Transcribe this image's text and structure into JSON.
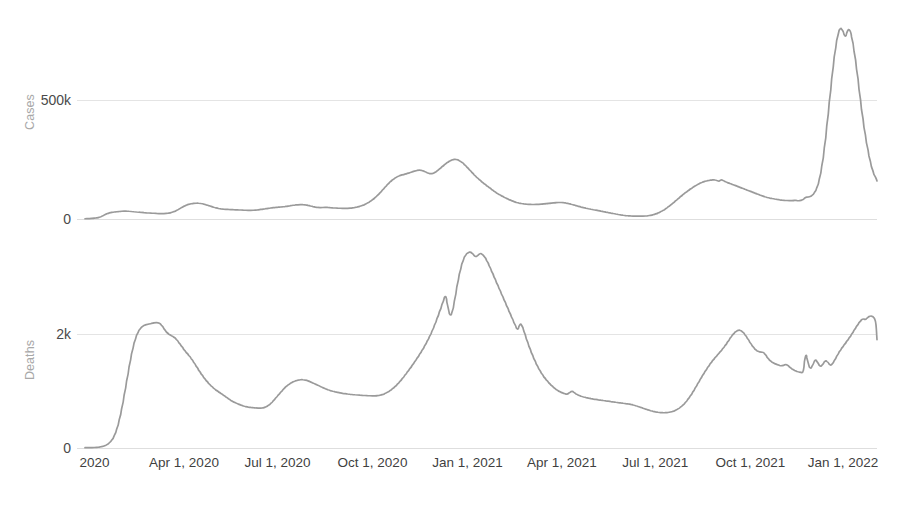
{
  "chart_data": {
    "type": "line",
    "title": "",
    "subtitle": "",
    "layout": "two stacked panels sharing one x axis",
    "grid": true,
    "legend": false,
    "legend_position": "none",
    "line_color": "#9a9a9a",
    "gridline_color": "#e4e4e4",
    "axis_label_color": "#a8a8a8",
    "tick_label_color": "#4a4a4a",
    "xlabel": "",
    "x_range": [
      "2020-01-22",
      "2022-02-20"
    ],
    "x_tick_labels": [
      "2020",
      "Apr 1, 2020",
      "Jul 1, 2020",
      "Oct 1, 2020",
      "Jan 1, 2021",
      "Apr 1, 2021",
      "Jul 1, 2021",
      "Oct 1, 2021",
      "Jan 1, 2022"
    ],
    "x_tick_positions_frac": [
      0.012,
      0.125,
      0.243,
      0.363,
      0.483,
      0.602,
      0.72,
      0.84,
      0.957
    ],
    "panels": [
      {
        "name": "cases",
        "ylabel": "Cases",
        "y_tick_labels": [
          "0",
          "500k"
        ],
        "y_tick_values": [
          0,
          500000
        ],
        "ylim": [
          0,
          1000000
        ],
        "series_name": "Cases",
        "description": "7-day average of new reported COVID-19 cases",
        "values": [
          1000,
          1500,
          2000,
          3000,
          4000,
          6000,
          9000,
          14000,
          20000,
          24000,
          27000,
          29000,
          30000,
          31000,
          32000,
          33000,
          33500,
          33000,
          32000,
          31000,
          30000,
          29000,
          28000,
          27000,
          26000,
          25500,
          25000,
          24500,
          24000,
          23000,
          22500,
          22500,
          23000,
          24000,
          26000,
          29000,
          33000,
          38000,
          44000,
          50000,
          56000,
          60000,
          63000,
          65000,
          66000,
          66500,
          66000,
          64000,
          61000,
          58000,
          55000,
          51000,
          48000,
          45000,
          43000,
          42000,
          41000,
          40500,
          40000,
          39500,
          39000,
          38500,
          38000,
          37500,
          37000,
          36500,
          36000,
          36500,
          37000,
          38000,
          39500,
          41000,
          42500,
          44000,
          45500,
          47000,
          48000,
          49000,
          50000,
          51000,
          52000,
          53500,
          55000,
          57000,
          58500,
          59500,
          60000,
          60500,
          60000,
          58500,
          56000,
          53500,
          51000,
          49000,
          48000,
          48000,
          48500,
          49000,
          48500,
          47500,
          46500,
          46000,
          45500,
          45000,
          44500,
          44500,
          45000,
          46000,
          47500,
          49500,
          52000,
          55000,
          59000,
          64000,
          70000,
          77000,
          85000,
          94000,
          104000,
          115000,
          127000,
          139000,
          150000,
          160000,
          168000,
          175000,
          180000,
          184000,
          187000,
          190000,
          193000,
          196000,
          200000,
          203000,
          205000,
          205000,
          202000,
          197000,
          192000,
          190000,
          192000,
          198000,
          206000,
          215000,
          224000,
          232000,
          240000,
          246000,
          250000,
          251000,
          248000,
          242000,
          234000,
          224000,
          213000,
          202000,
          191000,
          180000,
          170000,
          161000,
          152000,
          144000,
          136000,
          128000,
          120000,
          113000,
          106000,
          100000,
          94000,
          89000,
          84000,
          79000,
          75000,
          71000,
          68000,
          66000,
          64000,
          63000,
          62000,
          61500,
          61000,
          61000,
          61500,
          62000,
          63000,
          64000,
          65000,
          66000,
          67000,
          68000,
          69000,
          69500,
          69000,
          68000,
          66000,
          63500,
          60500,
          57500,
          54500,
          51500,
          49000,
          46500,
          44000,
          42000,
          40000,
          38000,
          36000,
          34000,
          32000,
          30000,
          28000,
          26000,
          24000,
          22000,
          20000,
          18000,
          16500,
          15000,
          14000,
          13000,
          12500,
          12000,
          11800,
          11700,
          11800,
          12200,
          13000,
          14500,
          16500,
          19500,
          23000,
          27500,
          33000,
          39000,
          46000,
          54000,
          62000,
          71000,
          80000,
          89000,
          98000,
          106000,
          114000,
          122000,
          129000,
          136000,
          142000,
          148000,
          153000,
          157000,
          160000,
          162000,
          164000,
          165000,
          163000,
          158000,
          166000,
          160000,
          155000,
          151000,
          147000,
          143000,
          139000,
          135000,
          131000,
          127000,
          123000,
          119000,
          115000,
          111000,
          107000,
          103000,
          99000,
          95000,
          92000,
          89000,
          87000,
          85000,
          83000,
          81500,
          80000,
          79000,
          78000,
          77500,
          77000,
          77500,
          79000,
          76000,
          78000,
          82000,
          92000,
          92000,
          95000,
          103000,
          118000,
          145000,
          190000,
          255000,
          340000,
          440000,
          540000,
          640000,
          720000,
          780000,
          806000,
          790000,
          760000,
          800000,
          790000,
          740000,
          670000,
          590000,
          500000,
          420000,
          350000,
          290000,
          240000,
          200000,
          175000,
          160000
        ]
      },
      {
        "name": "deaths",
        "ylabel": "Deaths",
        "y_tick_labels": [
          "0",
          "2k"
        ],
        "y_tick_values": [
          0,
          2000
        ],
        "ylim": [
          0,
          4000
        ],
        "series_name": "Deaths",
        "description": "7-day average of new reported COVID-19 deaths",
        "values": [
          5,
          5,
          6,
          8,
          10,
          14,
          20,
          30,
          45,
          70,
          110,
          170,
          260,
          400,
          580,
          800,
          1050,
          1300,
          1550,
          1760,
          1920,
          2030,
          2100,
          2140,
          2160,
          2170,
          2180,
          2190,
          2200,
          2200,
          2180,
          2130,
          2060,
          2010,
          1980,
          1960,
          1930,
          1880,
          1820,
          1760,
          1700,
          1650,
          1600,
          1540,
          1470,
          1400,
          1330,
          1270,
          1210,
          1160,
          1110,
          1070,
          1030,
          1000,
          970,
          940,
          910,
          880,
          850,
          820,
          800,
          780,
          760,
          745,
          730,
          720,
          715,
          710,
          705,
          700,
          698,
          700,
          710,
          730,
          760,
          800,
          850,
          900,
          950,
          1000,
          1050,
          1090,
          1120,
          1150,
          1170,
          1185,
          1195,
          1200,
          1195,
          1185,
          1170,
          1150,
          1130,
          1110,
          1090,
          1070,
          1050,
          1030,
          1015,
          1000,
          990,
          980,
          970,
          962,
          955,
          950,
          945,
          940,
          936,
          932,
          928,
          925,
          922,
          920,
          918,
          916,
          914,
          915,
          920,
          930,
          945,
          965,
          990,
          1020,
          1055,
          1095,
          1140,
          1190,
          1245,
          1300,
          1360,
          1420,
          1480,
          1545,
          1610,
          1680,
          1750,
          1830,
          1910,
          2000,
          2100,
          2210,
          2330,
          2450,
          2580,
          2700,
          2420,
          2300,
          2450,
          2700,
          2950,
          3150,
          3300,
          3390,
          3430,
          3440,
          3400,
          3350,
          3380,
          3420,
          3390,
          3330,
          3250,
          3150,
          3050,
          2950,
          2850,
          2750,
          2650,
          2550,
          2450,
          2350,
          2250,
          2150,
          2060,
          2200,
          2120,
          1980,
          1850,
          1730,
          1620,
          1520,
          1430,
          1350,
          1280,
          1220,
          1170,
          1120,
          1080,
          1040,
          1010,
          985,
          965,
          950,
          940,
          980,
          1000,
          960,
          935,
          915,
          900,
          890,
          880,
          870,
          862,
          855,
          848,
          842,
          836,
          830,
          824,
          818,
          812,
          806,
          800,
          794,
          788,
          782,
          776,
          770,
          760,
          748,
          735,
          720,
          705,
          690,
          675,
          660,
          648,
          638,
          630,
          624,
          620,
          618,
          620,
          626,
          636,
          650,
          670,
          696,
          730,
          772,
          822,
          880,
          945,
          1015,
          1090,
          1165,
          1240,
          1310,
          1380,
          1445,
          1505,
          1560,
          1610,
          1660,
          1710,
          1765,
          1825,
          1890,
          1955,
          2010,
          2050,
          2070,
          2060,
          2020,
          1960,
          1890,
          1820,
          1760,
          1715,
          1690,
          1680,
          1680,
          1620,
          1560,
          1520,
          1490,
          1470,
          1455,
          1440,
          1450,
          1470,
          1440,
          1400,
          1370,
          1350,
          1335,
          1325,
          1320,
          1700,
          1460,
          1380,
          1480,
          1560,
          1480,
          1420,
          1480,
          1540,
          1500,
          1440,
          1490,
          1570,
          1650,
          1720,
          1780,
          1840,
          1900,
          1960,
          2030,
          2100,
          2170,
          2230,
          2270,
          2250,
          2290,
          2320,
          2310,
          2260,
          1900
        ]
      }
    ]
  }
}
